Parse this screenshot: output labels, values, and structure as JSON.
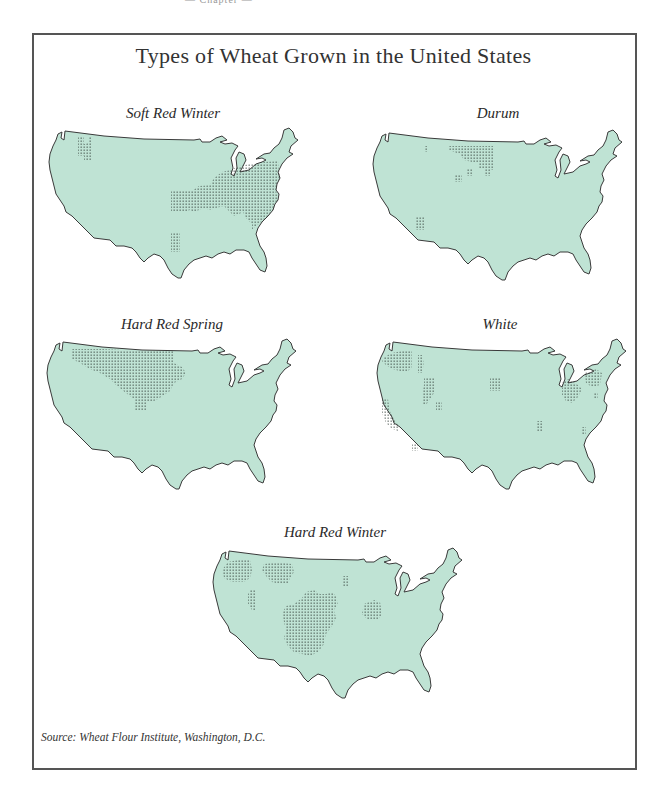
{
  "page": {
    "header": "— Chapter —"
  },
  "figure": {
    "title": "Types of Wheat Grown in the United States",
    "source": "Source: Wheat Flour Institute, Washington, D.C.",
    "colors": {
      "land_fill": "#bfe3d4",
      "outline": "#3a3a3a",
      "dot": "#2f3b36",
      "frame": "#555555"
    }
  },
  "maps": [
    {
      "id": "soft-red-winter",
      "title": "Soft Red Winter",
      "growing_regions": [
        "Pacific Northwest (small patch)",
        "Midwest / Ohio Valley",
        "Mid-Atlantic & Southeast",
        "Lower Mississippi"
      ]
    },
    {
      "id": "durum",
      "title": "Durum",
      "growing_regions": [
        "Northern Plains (North Dakota)",
        "Small patch in Montana",
        "South Dakota patches",
        "Arizona / Southwest"
      ]
    },
    {
      "id": "hard-red-spring",
      "title": "Hard Red Spring",
      "growing_regions": [
        "Northern Plains (Montana, Dakotas, Minnesota)"
      ]
    },
    {
      "id": "white",
      "title": "White",
      "growing_regions": [
        "Pacific Northwest",
        "California",
        "Idaho / Utah",
        "Nebraska",
        "Michigan / Ohio",
        "New York",
        "Scattered Southeast patches"
      ]
    },
    {
      "id": "hard-red-winter",
      "title": "Hard Red Winter",
      "growing_regions": [
        "Pacific Northwest",
        "Montana",
        "Idaho / Utah",
        "Great Plains (Kansas, Oklahoma, Texas, Colorado, Nebraska)",
        "Minnesota strip",
        "Illinois / Indiana"
      ]
    }
  ]
}
